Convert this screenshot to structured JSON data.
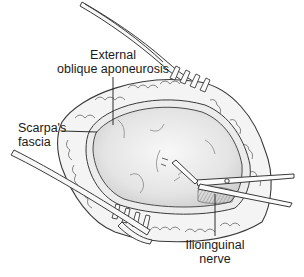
{
  "figure": {
    "colors": {
      "line": "#3a3a3a",
      "fat_fill": "#f4f4f4",
      "aponeurosis_fill": "#e2e2e2",
      "aponeurosis_highlight": "#f7f7f7",
      "nerve_shade": "#bdbdbd",
      "background": "#ffffff"
    }
  },
  "labels": {
    "external_oblique": {
      "line1": "External",
      "line2": "oblique aponeurosis"
    },
    "scarpas_fascia": {
      "line1": "Scarpa's",
      "line2": "fascia"
    },
    "ilioinguinal_nerve": {
      "line1": "Ilioinguinal",
      "line2": "nerve"
    }
  }
}
